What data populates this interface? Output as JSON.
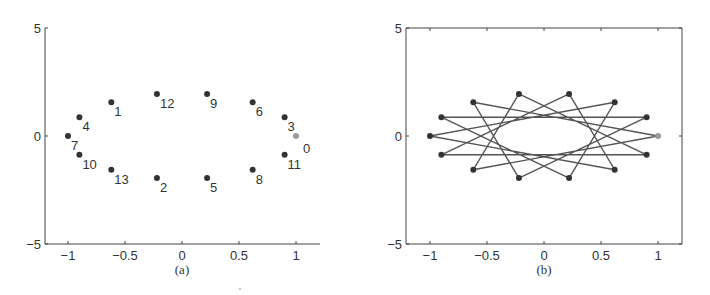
{
  "chart_data": [
    {
      "type": "scatter",
      "caption": "(a)",
      "title": "",
      "xlabel": "",
      "ylabel": "",
      "xlim": [
        -1.2,
        1.2
      ],
      "ylim": [
        -5,
        5
      ],
      "xticks": [
        "-1",
        "-0.5",
        "0",
        "0.5",
        "1"
      ],
      "yticks": [
        "5",
        "0",
        "-5"
      ],
      "grid": false,
      "box": false,
      "points": [
        {
          "label": "0",
          "x": 1.0,
          "y": 0.0,
          "highlight": true
        },
        {
          "label": "1",
          "x": -0.62,
          "y": 1.56
        },
        {
          "label": "2",
          "x": -0.22,
          "y": -1.95
        },
        {
          "label": "3",
          "x": 0.9,
          "y": 0.87
        },
        {
          "label": "4",
          "x": -0.9,
          "y": 0.87
        },
        {
          "label": "5",
          "x": 0.22,
          "y": -1.95
        },
        {
          "label": "6",
          "x": 0.62,
          "y": 1.56
        },
        {
          "label": "7",
          "x": -1.0,
          "y": 0.0
        },
        {
          "label": "8",
          "x": 0.62,
          "y": -1.56
        },
        {
          "label": "9",
          "x": 0.22,
          "y": 1.95
        },
        {
          "label": "10",
          "x": -0.9,
          "y": -0.87
        },
        {
          "label": "11",
          "x": 0.9,
          "y": -0.87
        },
        {
          "label": "12",
          "x": -0.22,
          "y": 1.95
        },
        {
          "label": "13",
          "x": -0.62,
          "y": -1.56
        }
      ]
    },
    {
      "type": "line",
      "caption": "(b)",
      "title": "",
      "xlabel": "",
      "ylabel": "",
      "xlim": [
        -1.2,
        1.2
      ],
      "ylim": [
        -5,
        5
      ],
      "xticks": [
        "-1",
        "-0.5",
        "0",
        "0.5",
        "1"
      ],
      "yticks": [
        "5",
        "0",
        "-5"
      ],
      "grid": false,
      "box": true,
      "description": "Same 14 points joined in label order 0→1→…→13→0, forming a {14/5} star polygon",
      "path_order": [
        0,
        1,
        2,
        3,
        4,
        5,
        6,
        7,
        8,
        9,
        10,
        11,
        12,
        13,
        0
      ]
    }
  ],
  "colors": {
    "axis": "#444444",
    "point": "#333333",
    "highlight_point": "#9a9a9a",
    "line": "#555555",
    "text": "#333333"
  }
}
